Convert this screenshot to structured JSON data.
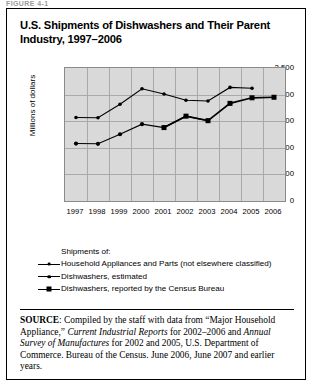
{
  "figure_label": "FIGURE 4-1",
  "title": "U.S. Shipments of Dishwashers and Their Parent Industry, 1997–2006",
  "legend": {
    "heading": "Shipments of:",
    "items": [
      {
        "label": "Household Appliances and Parts (not elsewhere classified)",
        "marker": "small-dot"
      },
      {
        "label": "Dishwashers, estimated",
        "marker": "medium-dot"
      },
      {
        "label": "Dishwashers, reported by the Census Bureau",
        "marker": "filled-square"
      }
    ]
  },
  "source": {
    "prefix": "SOURCE",
    "text_1": ": Compiled by the staff with data from “Major Household Appliance,” ",
    "italic_1": "Current Industrial Reports",
    "text_2": " for 2002–2006 and ",
    "italic_2": "Annual Survey of Manufactures",
    "text_3": " for 2002 and 2005, U.S. Department of Commerce. Bureau of the Census. June 2006, June 2007 and earlier years."
  },
  "chart_data": {
    "type": "line",
    "title": "U.S. Shipments of Dishwashers and Their Parent Industry, 1997–2006",
    "xlabel": "",
    "ylabel": "Millions of dollars",
    "categories": [
      "1997",
      "1998",
      "1999",
      "2000",
      "2001",
      "2002",
      "2003",
      "2004",
      "2005",
      "2006"
    ],
    "ylim": [
      0,
      2500
    ],
    "yticks": [
      0,
      500,
      1000,
      1500,
      2000,
      2500
    ],
    "ytick_labels": [
      "0",
      "500",
      "1,000",
      "1,500",
      "2,000",
      "2,500"
    ],
    "grid": true,
    "legend_position": "below-plot",
    "series": [
      {
        "name": "Household Appliances and Parts (not elsewhere classified)",
        "marker": "small-dot",
        "x": [
          "1997",
          "1998",
          "1999",
          "2000",
          "2001",
          "2002",
          "2003",
          "2004",
          "2005"
        ],
        "values": [
          1570,
          1565,
          1820,
          2110,
          2010,
          1895,
          1880,
          2135,
          2120
        ]
      },
      {
        "name": "Dishwashers, estimated",
        "marker": "medium-dot",
        "x": [
          "1997",
          "1998",
          "1999",
          "2000",
          "2001",
          "2002",
          "2003"
        ],
        "values": [
          1080,
          1075,
          1255,
          1445,
          1380,
          1595,
          1510
        ]
      },
      {
        "name": "Dishwashers, reported by the Census Bureau",
        "marker": "filled-square",
        "x": [
          "2001",
          "2002",
          "2003",
          "2004",
          "2005",
          "2006"
        ],
        "values": [
          1380,
          1595,
          1510,
          1835,
          1940,
          1950
        ]
      }
    ]
  }
}
